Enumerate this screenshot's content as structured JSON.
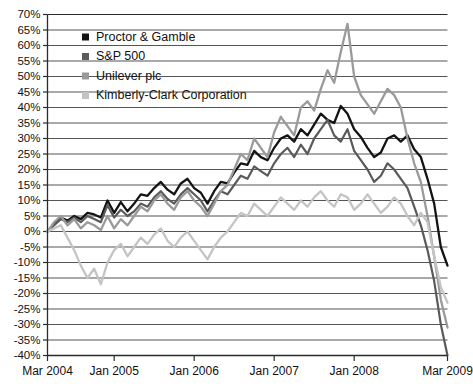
{
  "chart_data": {
    "type": "line",
    "title": "",
    "subtitle": "",
    "xlabel": "",
    "ylabel": "",
    "ylim": [
      -40,
      70
    ],
    "ytick_step": 5,
    "grid": true,
    "legend_position": "top-left",
    "ytick_labels": [
      "70%",
      "65%",
      "60%",
      "55%",
      "50%",
      "45%",
      "40%",
      "35%",
      "30%",
      "25%",
      "20%",
      "15%",
      "10%",
      "5%",
      "0%",
      "-5%",
      "-10%",
      "-15%",
      "-20%",
      "-25%",
      "-30%",
      "-35%",
      "-40%"
    ],
    "ytick_values": [
      70,
      65,
      60,
      55,
      50,
      45,
      40,
      35,
      30,
      25,
      20,
      15,
      10,
      5,
      0,
      -5,
      -10,
      -15,
      -20,
      -25,
      -30,
      -35,
      -40
    ],
    "xtick_labels": [
      "Mar 2004",
      "Jan 2005",
      "Jan 2006",
      "Jan 2007",
      "Jan 2008",
      "Mar 2009"
    ],
    "xtick_positions": [
      0,
      10,
      22,
      34,
      46,
      60
    ],
    "x_range": [
      0,
      60
    ],
    "x_unit": "months since Mar 2004",
    "series": [
      {
        "name": "Proctor & Gamble",
        "color": "#141414",
        "width": 2.3,
        "x": [
          0,
          1,
          2,
          3,
          4,
          5,
          6,
          7,
          8,
          9,
          10,
          11,
          12,
          13,
          14,
          15,
          16,
          17,
          18,
          19,
          20,
          21,
          22,
          23,
          24,
          25,
          26,
          27,
          28,
          29,
          30,
          31,
          32,
          33,
          34,
          35,
          36,
          37,
          38,
          39,
          40,
          41,
          42,
          43,
          44,
          45,
          46,
          47,
          48,
          49,
          50,
          51,
          52,
          53,
          54,
          55,
          56,
          57,
          58,
          59,
          60
        ],
        "values": [
          0,
          2.5,
          4.5,
          3.5,
          5,
          4,
          6,
          5.5,
          4.5,
          10,
          6,
          9.5,
          6.5,
          9,
          12,
          11.5,
          14,
          16,
          13.5,
          12,
          15.5,
          17,
          14,
          12.5,
          9,
          13,
          16,
          15.5,
          19,
          22,
          21.5,
          26,
          24,
          23,
          27,
          30,
          31,
          29,
          33,
          31,
          34.5,
          38,
          36,
          35,
          40.5,
          38,
          33,
          30.5,
          27,
          24,
          25.5,
          30,
          31,
          29,
          31,
          26.5,
          24,
          17,
          9,
          -5,
          -11
        ],
        "end_value": -11,
        "peak_value": 40.5
      },
      {
        "name": "S&P 500",
        "color": "#5a5a5a",
        "width": 2.2,
        "x": [
          0,
          1,
          2,
          3,
          4,
          5,
          6,
          7,
          8,
          9,
          10,
          11,
          12,
          13,
          14,
          15,
          16,
          17,
          18,
          19,
          20,
          21,
          22,
          23,
          24,
          25,
          26,
          27,
          28,
          29,
          30,
          31,
          32,
          33,
          34,
          35,
          36,
          37,
          38,
          39,
          40,
          41,
          42,
          43,
          44,
          45,
          46,
          47,
          48,
          49,
          50,
          51,
          52,
          53,
          54,
          55,
          56,
          57,
          58,
          59,
          60
        ],
        "values": [
          0,
          2,
          4,
          3,
          4.5,
          3,
          5,
          4,
          3,
          8.5,
          4.5,
          7,
          5,
          6.5,
          9,
          8,
          11,
          13,
          10.5,
          9,
          12,
          14,
          12,
          10,
          6.5,
          10,
          13,
          12,
          15,
          18,
          17,
          21,
          19.5,
          18,
          22,
          25,
          27,
          24,
          28,
          25,
          30,
          33,
          36,
          31,
          29,
          33,
          26,
          23,
          20,
          16,
          18,
          22,
          20,
          17,
          14,
          8,
          2,
          -6,
          -16,
          -30,
          -40
        ],
        "end_value": -40,
        "peak_value": 36
      },
      {
        "name": "Unilever plc",
        "color": "#9a9a9a",
        "width": 2.3,
        "x": [
          0,
          1,
          2,
          3,
          4,
          5,
          6,
          7,
          8,
          9,
          10,
          11,
          12,
          13,
          14,
          15,
          16,
          17,
          18,
          19,
          20,
          21,
          22,
          23,
          24,
          25,
          26,
          27,
          28,
          29,
          30,
          31,
          32,
          33,
          34,
          35,
          36,
          37,
          38,
          39,
          40,
          41,
          42,
          43,
          44,
          45,
          46,
          47,
          48,
          49,
          50,
          51,
          52,
          53,
          54,
          55,
          56,
          57,
          58,
          59,
          60
        ],
        "values": [
          0,
          3,
          5,
          2,
          4,
          1,
          3,
          2,
          0.5,
          5,
          1,
          4,
          2,
          5,
          8,
          6.5,
          10,
          12,
          9,
          7,
          11,
          13,
          10,
          8,
          5,
          9,
          13,
          15,
          20,
          25,
          23,
          30,
          27,
          24,
          32,
          37,
          34,
          31,
          40,
          42,
          39,
          46,
          52,
          48,
          58,
          67,
          50,
          44,
          41,
          38,
          42,
          46,
          44,
          40,
          30,
          22,
          16,
          5,
          -8,
          -22,
          -31
        ],
        "end_value": -31,
        "peak_value": 67
      },
      {
        "name": "Kimberly-Clark Corporation",
        "color": "#c4c4c4",
        "width": 2.3,
        "x": [
          0,
          1,
          2,
          3,
          4,
          5,
          6,
          7,
          8,
          9,
          10,
          11,
          12,
          13,
          14,
          15,
          16,
          17,
          18,
          19,
          20,
          21,
          22,
          23,
          24,
          25,
          26,
          27,
          28,
          29,
          30,
          31,
          32,
          33,
          34,
          35,
          36,
          37,
          38,
          39,
          40,
          41,
          42,
          43,
          44,
          45,
          46,
          47,
          48,
          49,
          50,
          51,
          52,
          53,
          54,
          55,
          56,
          57,
          58,
          59,
          60
        ],
        "values": [
          0,
          1,
          2,
          -2,
          -6,
          -11,
          -15,
          -12,
          -17,
          -10,
          -6,
          -4,
          -8,
          -5,
          -2,
          -4,
          -1,
          1,
          -3,
          -5,
          -2,
          0,
          -3,
          -6,
          -9,
          -5,
          -2,
          0,
          3,
          6,
          5,
          9,
          7,
          5,
          8,
          11,
          9,
          7,
          10,
          8,
          11,
          13,
          10,
          8,
          12,
          11,
          7,
          9,
          12,
          9,
          6,
          8,
          11,
          9,
          5,
          2,
          6,
          3,
          -8,
          -18,
          -23
        ],
        "end_value": -23,
        "peak_value": 13
      }
    ]
  },
  "legend": {
    "items": [
      {
        "label": "Proctor & Gamble",
        "color": "#141414"
      },
      {
        "label": "S&P 500",
        "color": "#5a5a5a"
      },
      {
        "label": "Unilever plc",
        "color": "#9a9a9a"
      },
      {
        "label": "Kimberly-Clark Corporation",
        "color": "#c4c4c4"
      }
    ]
  },
  "axes": {
    "gridline_color": "#555555",
    "axis_color": "#2b2b2b",
    "background": "#ffffff"
  }
}
